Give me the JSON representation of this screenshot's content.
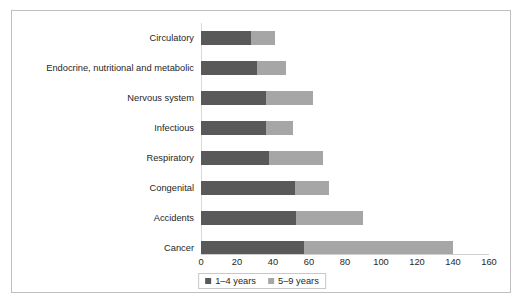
{
  "chart_data": {
    "type": "bar",
    "orientation": "horizontal",
    "stacked": true,
    "title": "",
    "xlabel": "",
    "ylabel": "",
    "xlim": [
      0,
      160
    ],
    "xticks": [
      0,
      20,
      40,
      60,
      80,
      100,
      120,
      140,
      160
    ],
    "xtick_labels": [
      "0",
      "20",
      "40",
      "60",
      "80",
      "100",
      "120",
      "140",
      "160"
    ],
    "grid": false,
    "legend_position": "bottom-center",
    "categories": [
      "Circulatory",
      "Endocrine, nutritional and metabolic",
      "Nervous system",
      "Infectious",
      "Respiratory",
      "Congenital",
      "Accidents",
      "Cancer"
    ],
    "series": [
      {
        "name": "1–4 years",
        "color": "#595959",
        "values": [
          28,
          31,
          36,
          36,
          38,
          52,
          53,
          57
        ]
      },
      {
        "name": "5–9 years",
        "color": "#a6a6a6",
        "values": [
          13,
          16,
          26,
          15,
          30,
          19,
          37,
          83
        ]
      }
    ],
    "totals": [
      41,
      47,
      62,
      51,
      68,
      71,
      90,
      140
    ]
  },
  "legend": {
    "items": [
      {
        "label": "1–4 years",
        "color": "#595959"
      },
      {
        "label": "5–9 years",
        "color": "#a6a6a6"
      }
    ]
  },
  "colors": {
    "series_1_4": "#595959",
    "series_5_9": "#a6a6a6",
    "frame_border": "#bfbfbf",
    "axis_line": "#d0d0d0",
    "text": "#262626",
    "background": "#ffffff"
  }
}
